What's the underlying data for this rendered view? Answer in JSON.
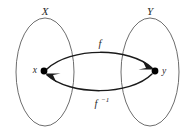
{
  "figure": {
    "sets": [
      {
        "id": "domain",
        "label": "X",
        "cx": 45,
        "cy": 72,
        "rx": 29,
        "ry": 54,
        "label_x": 45,
        "label_y": 12
      },
      {
        "id": "codomain",
        "label": "Y",
        "cx": 150,
        "cy": 72,
        "rx": 29,
        "ry": 54,
        "label_x": 150,
        "label_y": 12
      }
    ],
    "elements": [
      {
        "id": "x-element",
        "label": "x",
        "cx": 44,
        "cy": 71,
        "r": 3.4,
        "label_x": 37,
        "label_y": 71
      },
      {
        "id": "y-element",
        "label": "y",
        "cx": 155,
        "cy": 71,
        "r": 3.4,
        "label_x": 162,
        "label_y": 72
      }
    ],
    "maps": [
      {
        "id": "forward-map",
        "label": "f",
        "superscript": "",
        "direction": "x-to-y",
        "label_x": 100,
        "label_y": 45,
        "path": "M 47 69 C 70 47, 130 47, 152 68",
        "arrow_points": "152,68 143,61 147,69 140,71"
      },
      {
        "id": "inverse-map",
        "label": "f",
        "superscript": "−1",
        "direction": "y-to-x",
        "label_x": 99,
        "label_y": 105,
        "path": "M 152 74 C 130 96, 70 96, 47 75",
        "arrow_points": "47,75 56,82 52,74 59,72"
      }
    ],
    "colors": {
      "ellipse_stroke": "#5c5c5c",
      "curve_stroke": "#1a1a1a",
      "dot_fill": "#000000",
      "label_fill": "#2b2b2b",
      "background": "#ffffff"
    }
  }
}
